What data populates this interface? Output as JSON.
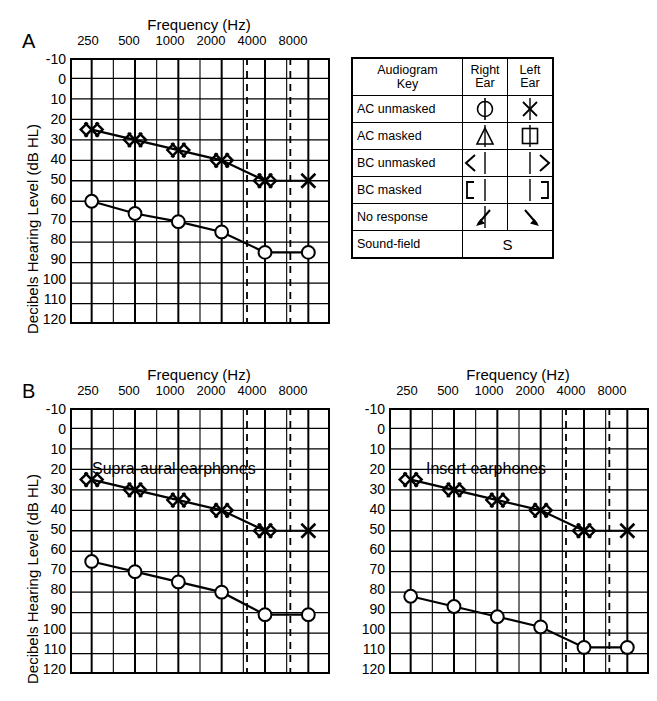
{
  "figure": {
    "panels": [
      {
        "id": "A",
        "letter": "A",
        "axis": {
          "x_title": "Frequency (Hz)",
          "y_title": "Decibels Hearing Level (dB HL)",
          "x_ticks": [
            "250",
            "500",
            "1000",
            "2000",
            "4000",
            "8000"
          ],
          "x_tick_values": [
            250,
            500,
            1000,
            2000,
            4000,
            8000
          ],
          "y_ticks": [
            "-10",
            "0",
            "10",
            "20",
            "30",
            "40",
            "50",
            "60",
            "70",
            "80",
            "90",
            "100",
            "110",
            "120"
          ],
          "ylim": [
            -10,
            120
          ],
          "xlim_hz": [
            177,
            11314
          ],
          "dashed_gridlines_hz": [
            3000,
            6000
          ]
        },
        "inner_label": ""
      },
      {
        "id": "B-left",
        "letter": "B",
        "axis": {
          "x_title": "Frequency (Hz)",
          "y_title": "Decibels Hearing Level (dB HL)",
          "x_ticks": [
            "250",
            "500",
            "1000",
            "2000",
            "4000",
            "8000"
          ],
          "x_tick_values": [
            250,
            500,
            1000,
            2000,
            4000,
            8000
          ],
          "y_ticks": [
            "-10",
            "0",
            "10",
            "20",
            "30",
            "40",
            "50",
            "60",
            "70",
            "80",
            "90",
            "100",
            "110",
            "120"
          ],
          "ylim": [
            -10,
            120
          ],
          "xlim_hz": [
            177,
            11314
          ],
          "dashed_gridlines_hz": [
            3000,
            6000
          ]
        },
        "inner_label": "Supra-aural earphones"
      },
      {
        "id": "B-right",
        "letter": "",
        "axis": {
          "x_title": "Frequency (Hz)",
          "y_title": "",
          "x_ticks": [
            "250",
            "500",
            "1000",
            "2000",
            "4000",
            "8000"
          ],
          "x_tick_values": [
            250,
            500,
            1000,
            2000,
            4000,
            8000
          ],
          "y_ticks": [
            "-10",
            "0",
            "10",
            "20",
            "30",
            "40",
            "50",
            "60",
            "70",
            "80",
            "90",
            "100",
            "110",
            "120"
          ],
          "ylim": [
            -10,
            120
          ],
          "xlim_hz": [
            177,
            11314
          ],
          "dashed_gridlines_hz": [
            3000,
            6000
          ]
        },
        "inner_label": "Insert earphones"
      }
    ]
  },
  "chart_data": [
    {
      "panel": "A",
      "type": "line",
      "title": "",
      "xlabel": "Frequency (Hz)",
      "ylabel": "Decibels Hearing Level (dB HL)",
      "x": [
        250,
        500,
        1000,
        2000,
        4000,
        8000
      ],
      "xtick_labels": [
        "250",
        "500",
        "1000",
        "2000",
        "4000",
        "8000"
      ],
      "ylim": [
        -10,
        120
      ],
      "y_inverted": true,
      "grid": true,
      "legend": "external-key-table",
      "series": [
        {
          "name": "Bone conduction / AC left (masked cluster)",
          "symbol": "composite-bc-ac",
          "values": [
            25,
            30,
            35,
            40,
            50,
            50
          ],
          "connected_through_hz": [
            250,
            500,
            1000,
            2000,
            4000
          ],
          "isolated_points_hz": [
            8000
          ]
        },
        {
          "name": "Air conduction right unmasked",
          "symbol": "circle",
          "values": [
            60,
            66,
            70,
            75,
            85,
            85
          ]
        }
      ]
    },
    {
      "panel": "B-left",
      "type": "line",
      "title": "Supra-aural earphones",
      "xlabel": "Frequency (Hz)",
      "ylabel": "Decibels Hearing Level (dB HL)",
      "x": [
        250,
        500,
        1000,
        2000,
        4000,
        8000
      ],
      "xtick_labels": [
        "250",
        "500",
        "1000",
        "2000",
        "4000",
        "8000"
      ],
      "ylim": [
        -10,
        120
      ],
      "y_inverted": true,
      "grid": true,
      "series": [
        {
          "name": "Bone conduction / AC left (masked cluster)",
          "symbol": "composite-bc-ac",
          "values": [
            25,
            30,
            35,
            40,
            50,
            50
          ],
          "connected_through_hz": [
            250,
            500,
            1000,
            2000,
            4000
          ],
          "isolated_points_hz": [
            8000
          ]
        },
        {
          "name": "Air conduction right unmasked",
          "symbol": "circle",
          "values": [
            65,
            70,
            75,
            80,
            91,
            91
          ]
        }
      ]
    },
    {
      "panel": "B-right",
      "type": "line",
      "title": "Insert earphones",
      "xlabel": "Frequency (Hz)",
      "ylabel": "",
      "x": [
        250,
        500,
        1000,
        2000,
        4000,
        8000
      ],
      "xtick_labels": [
        "250",
        "500",
        "1000",
        "2000",
        "4000",
        "8000"
      ],
      "ylim": [
        -10,
        120
      ],
      "y_inverted": true,
      "grid": true,
      "series": [
        {
          "name": "Bone conduction / AC left (masked cluster)",
          "symbol": "composite-bc-ac",
          "values": [
            25,
            30,
            35,
            40,
            50,
            50
          ],
          "connected_through_hz": [
            250,
            500,
            1000,
            2000,
            4000
          ],
          "isolated_points_hz": [
            8000
          ]
        },
        {
          "name": "Air conduction right unmasked",
          "symbol": "circle",
          "values": [
            82,
            87,
            92,
            97,
            107,
            107
          ]
        }
      ]
    }
  ],
  "legend_table": {
    "header": {
      "title_line1": "Audiogram",
      "title_line2": "Key",
      "right_line1": "Right",
      "right_line2": "Ear",
      "left_line1": "Left",
      "left_line2": "Ear"
    },
    "rows": [
      {
        "label": "AC unmasked",
        "right_symbol": "circle-icon",
        "left_symbol": "x-icon"
      },
      {
        "label": "AC masked",
        "right_symbol": "triangle-icon",
        "left_symbol": "square-icon"
      },
      {
        "label": "BC unmasked",
        "right_symbol": "less-than-icon",
        "left_symbol": "greater-than-icon"
      },
      {
        "label": "BC masked",
        "right_symbol": "left-bracket-icon",
        "left_symbol": "right-bracket-icon"
      },
      {
        "label": "No response",
        "right_symbol": "arrow-down-left-icon",
        "left_symbol": "arrow-down-right-icon"
      }
    ],
    "footer": {
      "label": "Sound-field",
      "symbol_text": "S"
    }
  },
  "colors": {
    "ink": "#000000",
    "background": "#ffffff",
    "gridline": "#2a2a2a",
    "minor_gridline": "#555555"
  }
}
